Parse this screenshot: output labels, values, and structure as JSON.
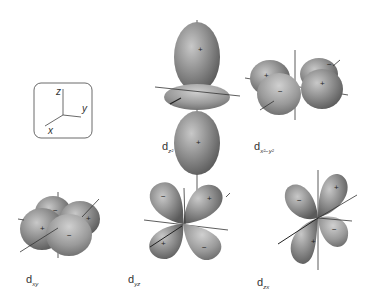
{
  "axes_box": {
    "z": "z",
    "y": "y",
    "x": "x"
  },
  "orbitals": [
    {
      "id": "dz2",
      "main": "d",
      "sub": "z²"
    },
    {
      "id": "dx2-y2",
      "main": "d",
      "sub": "x²−y²"
    },
    {
      "id": "dxy",
      "main": "d",
      "sub": "xy"
    },
    {
      "id": "dyz",
      "main": "d",
      "sub": "yz"
    },
    {
      "id": "dzx",
      "main": "d",
      "sub": "zx"
    }
  ],
  "signs": {
    "plus": "+",
    "minus": "−"
  },
  "colors": {
    "lobe_dark": "#6a6a6a",
    "lobe_light": "#bdbdbd",
    "axis": "#333333"
  }
}
